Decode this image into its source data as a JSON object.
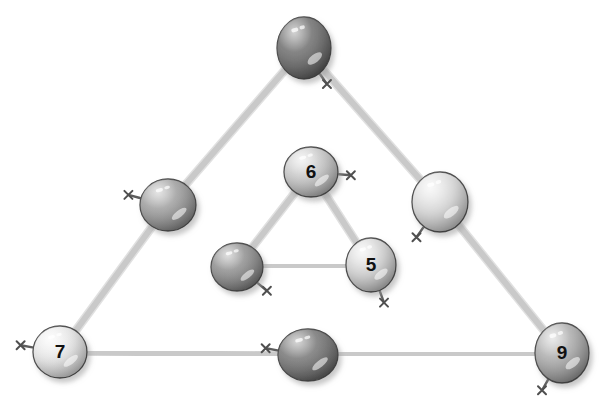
{
  "scene": {
    "title": "Balloon triangle number puzzle",
    "background_color": "#ffffff",
    "width": 604,
    "height": 407,
    "string_color": "#c9c9c9",
    "string_color_dark": "#b0b0b0",
    "outline_color": "#4a4a4a",
    "number_color": "#111111",
    "shadow_color": "#bdbdbd"
  },
  "chart_data": {
    "type": "diagram",
    "nodes": [
      {
        "id": "outer-top",
        "label": "",
        "cx": 304,
        "cy": 48,
        "rx": 27,
        "ry": 31,
        "shade": "dark",
        "fill": "#6e6e6e",
        "fill_light": "#8c8c8c",
        "fill_dark": "#565656",
        "knot_angle": 55,
        "triangle": "outer",
        "position": "apex"
      },
      {
        "id": "outer-left-mid",
        "label": "",
        "cx": 168,
        "cy": 205,
        "rx": 28,
        "ry": 26,
        "shade": "medium",
        "fill": "#9a9a9a",
        "fill_light": "#bdbdbd",
        "fill_dark": "#7d7d7d",
        "knot_angle": 195,
        "triangle": "outer",
        "position": "left-edge"
      },
      {
        "id": "outer-right-mid",
        "label": "",
        "cx": 440,
        "cy": 202,
        "rx": 28,
        "ry": 30,
        "shade": "light",
        "fill": "#d6d6d6",
        "fill_light": "#efefef",
        "fill_dark": "#b6b6b6",
        "knot_angle": 125,
        "triangle": "outer",
        "position": "right-edge"
      },
      {
        "id": "outer-bottom-left",
        "label": "7",
        "cx": 60,
        "cy": 352,
        "rx": 27,
        "ry": 26,
        "shade": "very-light",
        "fill": "#e2e2e2",
        "fill_light": "#f7f7f7",
        "fill_dark": "#c2c2c2",
        "knot_angle": 190,
        "triangle": "outer",
        "position": "bottom-left"
      },
      {
        "id": "outer-bottom-mid",
        "label": "",
        "cx": 308,
        "cy": 355,
        "rx": 30,
        "ry": 26,
        "shade": "dark",
        "fill": "#757575",
        "fill_light": "#949494",
        "fill_dark": "#5d5d5d",
        "knot_angle": 190,
        "triangle": "outer",
        "position": "bottom-edge"
      },
      {
        "id": "outer-bottom-right",
        "label": "9",
        "cx": 562,
        "cy": 353,
        "rx": 27,
        "ry": 30,
        "shade": "medium",
        "fill": "#a8a8a8",
        "fill_light": "#cccccc",
        "fill_dark": "#8a8a8a",
        "knot_angle": 120,
        "triangle": "outer",
        "position": "bottom-right"
      },
      {
        "id": "inner-top",
        "label": "6",
        "cx": 311,
        "cy": 172,
        "rx": 27,
        "ry": 25,
        "shade": "light-medium",
        "fill": "#c3c3c3",
        "fill_light": "#e4e4e4",
        "fill_dark": "#a3a3a3",
        "knot_angle": 5,
        "triangle": "inner",
        "position": "apex"
      },
      {
        "id": "inner-bottom-left",
        "label": "",
        "cx": 237,
        "cy": 267,
        "rx": 26,
        "ry": 24,
        "shade": "medium-dark",
        "fill": "#8c8c8c",
        "fill_light": "#adadad",
        "fill_dark": "#717171",
        "knot_angle": 40,
        "triangle": "inner",
        "position": "bottom-left"
      },
      {
        "id": "inner-bottom-right",
        "label": "5",
        "cx": 371,
        "cy": 265,
        "rx": 25,
        "ry": 27,
        "shade": "light",
        "fill": "#cfcfcf",
        "fill_light": "#ededed",
        "fill_dark": "#aeaeae",
        "knot_angle": 70,
        "triangle": "inner",
        "position": "bottom-right"
      }
    ],
    "edges": [
      {
        "id": "edge-outer-left",
        "from": "outer-top",
        "to": "outer-bottom-left",
        "via": "outer-left-mid"
      },
      {
        "id": "edge-outer-right",
        "from": "outer-top",
        "to": "outer-bottom-right",
        "via": "outer-right-mid"
      },
      {
        "id": "edge-outer-bottom",
        "from": "outer-bottom-left",
        "to": "outer-bottom-right",
        "via": "outer-bottom-mid"
      },
      {
        "id": "edge-inner-left",
        "from": "inner-top",
        "to": "inner-bottom-left",
        "via": null
      },
      {
        "id": "edge-inner-right",
        "from": "inner-top",
        "to": "inner-bottom-right",
        "via": null
      },
      {
        "id": "edge-inner-bottom",
        "from": "inner-bottom-left",
        "to": "inner-bottom-right",
        "via": null
      }
    ],
    "labels_visible": [
      "7",
      "9",
      "6",
      "5"
    ],
    "blank_balloons": 5
  }
}
